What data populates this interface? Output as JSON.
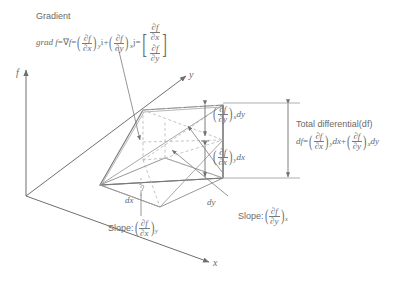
{
  "figure": {
    "background_color": "#ffffff",
    "line_color": "#7a7a7a",
    "dashed_color": "#b4b4b4",
    "text_color": "#6a6a6a"
  },
  "axes": {
    "f": "f",
    "y": "y",
    "x": "x"
  },
  "gradient": {
    "title": "Gradient",
    "lhs": "grad f",
    "eq1": "=",
    "nabla": "∇",
    "nabla_f": "f",
    "eq2": "=",
    "term1": {
      "numerator": "∂f",
      "denominator": "∂x",
      "subscript": "y",
      "unit_vector": "i"
    },
    "plus": "+",
    "term2": {
      "numerator": "∂f",
      "denominator": "∂y",
      "subscript": "x",
      "unit_vector": "j"
    },
    "eq3": "=",
    "column_vector": [
      {
        "numerator": "∂f",
        "denominator": "∂x"
      },
      {
        "numerator": "∂f",
        "denominator": "∂y"
      }
    ],
    "bracket_left": "[",
    "bracket_right": "]"
  },
  "total_differential": {
    "title": "Total  differential(df)",
    "lhs": "df",
    "eq": "=",
    "term1": {
      "numerator": "∂f",
      "denominator": "∂x",
      "subscript": "y",
      "diff": "dx"
    },
    "plus": "+",
    "term2": {
      "numerator": "∂f",
      "denominator": "∂y",
      "subscript": "x",
      "diff": "dy"
    }
  },
  "segments": {
    "upper": {
      "numerator": "∂f",
      "denominator": "∂y",
      "subscript": "x",
      "diff": "dy"
    },
    "lower": {
      "numerator": "∂f",
      "denominator": "∂x",
      "subscript": "y",
      "diff": "dx"
    }
  },
  "slopes": {
    "x": {
      "label": "Slope:",
      "numerator": "∂f",
      "denominator": "∂x",
      "subscript": "y"
    },
    "y": {
      "label": "Slope:",
      "numerator": "∂f",
      "denominator": "∂y",
      "subscript": "x"
    }
  },
  "increments": {
    "dx": "dx",
    "dy": "dy"
  }
}
